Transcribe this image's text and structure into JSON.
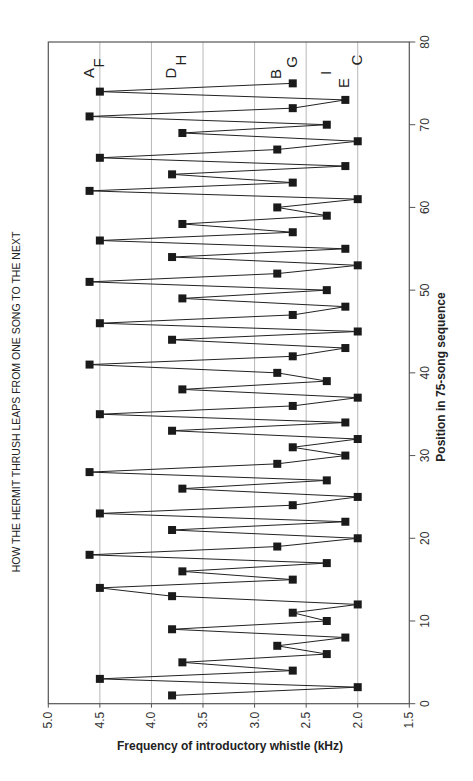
{
  "chart_data": {
    "type": "line",
    "title": "HOW THE HERMIT THRUSH LEAPS FROM ONE SONG TO THE NEXT",
    "xlabel": "Position in 75-song sequence",
    "ylabel": "Frequency of introductory whistle (kHz)",
    "orientation": "rotated 90° counter-clockwise (position axis vertical on right, frequency axis horizontal at bottom, reversed)",
    "xlim": [
      0,
      80
    ],
    "ylim": [
      1.5,
      5.0
    ],
    "x_ticks": [
      0,
      10,
      20,
      30,
      40,
      50,
      60,
      70,
      80
    ],
    "y_ticks": [
      5.0,
      4.5,
      4.0,
      3.5,
      3.0,
      2.5,
      2.0,
      1.5
    ],
    "grid": "gridlines at each frequency tick",
    "marker": "filled square",
    "series": [
      {
        "name": "Introductory whistle frequency",
        "x": [
          1,
          2,
          3,
          4,
          5,
          6,
          7,
          8,
          9,
          10,
          11,
          12,
          13,
          14,
          15,
          16,
          17,
          18,
          19,
          20,
          21,
          22,
          23,
          24,
          25,
          26,
          27,
          28,
          29,
          30,
          31,
          32,
          33,
          34,
          35,
          36,
          37,
          38,
          39,
          40,
          41,
          42,
          43,
          44,
          45,
          46,
          47,
          48,
          49,
          50,
          51,
          52,
          53,
          54,
          55,
          56,
          57,
          58,
          59,
          60,
          61,
          62,
          63,
          64,
          65,
          66,
          67,
          68,
          69,
          70,
          71,
          72,
          73,
          74,
          75
        ],
        "values": [
          3.8,
          2.0,
          4.5,
          2.63,
          3.7,
          2.3,
          2.78,
          2.12,
          3.8,
          2.3,
          2.63,
          2.0,
          3.8,
          4.5,
          2.63,
          3.7,
          2.3,
          4.6,
          2.78,
          2.0,
          3.8,
          2.12,
          4.5,
          2.63,
          2.0,
          3.7,
          2.3,
          4.6,
          2.78,
          2.12,
          2.63,
          2.0,
          3.8,
          2.12,
          4.5,
          2.63,
          2.0,
          3.7,
          2.3,
          2.78,
          4.6,
          2.63,
          2.12,
          3.8,
          2.0,
          4.5,
          2.63,
          2.12,
          3.7,
          2.3,
          4.6,
          2.78,
          2.0,
          3.8,
          2.12,
          4.5,
          2.63,
          3.7,
          2.3,
          2.78,
          2.0,
          4.6,
          2.63,
          3.8,
          2.12,
          4.5,
          2.78,
          2.0,
          3.7,
          2.3,
          4.6,
          2.63,
          2.12,
          4.5,
          2.63
        ]
      }
    ],
    "annotations": [
      {
        "text": "A",
        "freq": 4.6
      },
      {
        "text": "F",
        "freq": 4.5
      },
      {
        "text": "D",
        "freq": 3.8
      },
      {
        "text": "H",
        "freq": 3.7
      },
      {
        "text": "B",
        "freq": 2.78
      },
      {
        "text": "G",
        "freq": 2.63
      },
      {
        "text": "I",
        "freq": 2.3
      },
      {
        "text": "E",
        "freq": 2.12
      },
      {
        "text": "C",
        "freq": 2.0
      }
    ]
  },
  "colors": {
    "background": "#ffffff",
    "line": "#222222",
    "marker": "#1a1a1a",
    "grid": "#b8b8b8",
    "frame": "#555555"
  }
}
